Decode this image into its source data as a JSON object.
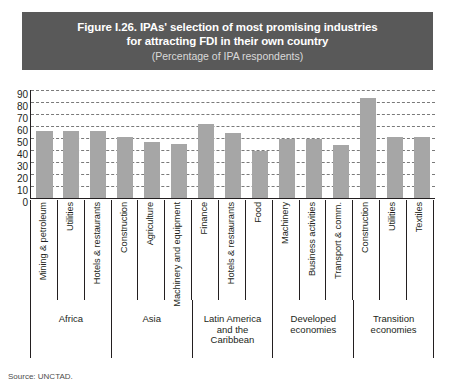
{
  "banner": {
    "title_line1": "Figure I.26. IPAs' selection of most promising industries",
    "title_line2": "for attracting FDI in their own country",
    "subtitle": "(Percentage of IPA respondents)",
    "background_color": "#595959",
    "text_color": "#ffffff"
  },
  "source": {
    "label": "Source: UNCTAD."
  },
  "chart_data": {
    "type": "bar",
    "title": "Figure I.26. IPAs' selection of most promising industries for attracting FDI in their own country",
    "subtitle": "(Percentage of IPA respondents)",
    "xlabel": "",
    "ylabel": "",
    "ylim": [
      0,
      90
    ],
    "yticks": [
      90,
      80,
      70,
      60,
      50,
      40,
      30,
      20,
      10,
      0
    ],
    "grid": true,
    "legend": "none",
    "bar_color": "#a6a6a6",
    "categories": [
      "Mining & petroleum",
      "Utilities",
      "Hotels & restaurants",
      "Construction",
      "Agriculture",
      "Machinery and equipment",
      "Finance",
      "Hotels & restaurants",
      "Food",
      "Machinery",
      "Business activities",
      "Transport & comm.",
      "Construction",
      "Utilities",
      "Textiles"
    ],
    "values": [
      56,
      56,
      56,
      51,
      47,
      45,
      62,
      54,
      39,
      49,
      49,
      44,
      83,
      51,
      51
    ],
    "groups": [
      {
        "label": "Africa",
        "span": 3
      },
      {
        "label": "Asia",
        "span": 3
      },
      {
        "label": "Latin America\nand the\nCaribbean",
        "span": 3
      },
      {
        "label": "Developed\neconomies",
        "span": 3
      },
      {
        "label": "Transition\neconomies",
        "span": 3
      }
    ]
  }
}
